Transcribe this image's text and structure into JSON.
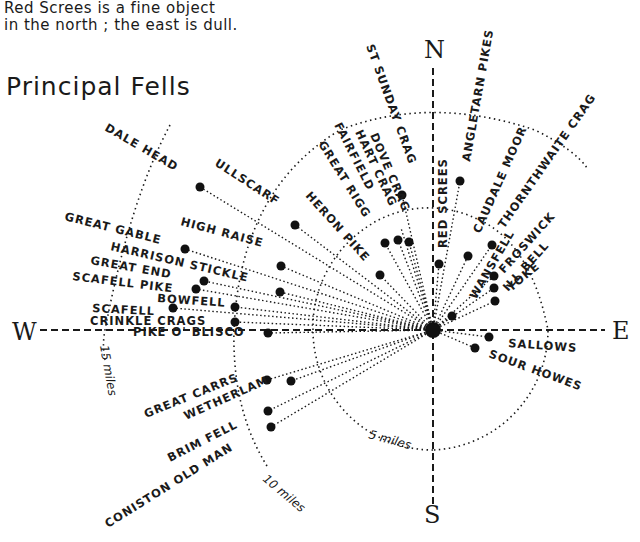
{
  "caption": {
    "line1": "Red Screes is a fine object",
    "line2": "in the north ; the east is dull."
  },
  "title": "Principal Fells",
  "compass": {
    "north": "N",
    "south": "S",
    "east": "E",
    "west": "W"
  },
  "distance_rings": [
    {
      "label": "5 miles"
    },
    {
      "label": "10 miles"
    },
    {
      "label": "15 miles"
    }
  ],
  "fells": [
    {
      "name": "DALE HEAD"
    },
    {
      "name": "ULLSCARF"
    },
    {
      "name": "HERON PIKE"
    },
    {
      "name": "GREAT RIGG"
    },
    {
      "name": "FAIRFIELD"
    },
    {
      "name": "HART CRAG"
    },
    {
      "name": "DOVE CRAG"
    },
    {
      "name": "ST SUNDAY CRAG"
    },
    {
      "name": "RED SCREES"
    },
    {
      "name": "ANGLETARN PIKES"
    },
    {
      "name": "CAUDALE MOOR"
    },
    {
      "name": "THORNTHWAITE CRAG"
    },
    {
      "name": "FROSWICK"
    },
    {
      "name": "ILL BELL"
    },
    {
      "name": "YOKE"
    },
    {
      "name": "WANSFELL"
    },
    {
      "name": "SALLOWS"
    },
    {
      "name": "SOUR HOWES"
    },
    {
      "name": "GREAT GABLE"
    },
    {
      "name": "HIGH RAISE"
    },
    {
      "name": "HARRISON STICKLE"
    },
    {
      "name": "GREAT END"
    },
    {
      "name": "SCAFELL PIKE"
    },
    {
      "name": "BOWFELL"
    },
    {
      "name": "SCAFELL"
    },
    {
      "name": "CRINKLE CRAGS"
    },
    {
      "name": "PIKE O' BLISCO"
    },
    {
      "name": "GREAT CARRS"
    },
    {
      "name": "WETHERLAM"
    },
    {
      "name": "BRIM FELL"
    },
    {
      "name": "CONISTON OLD MAN"
    }
  ]
}
